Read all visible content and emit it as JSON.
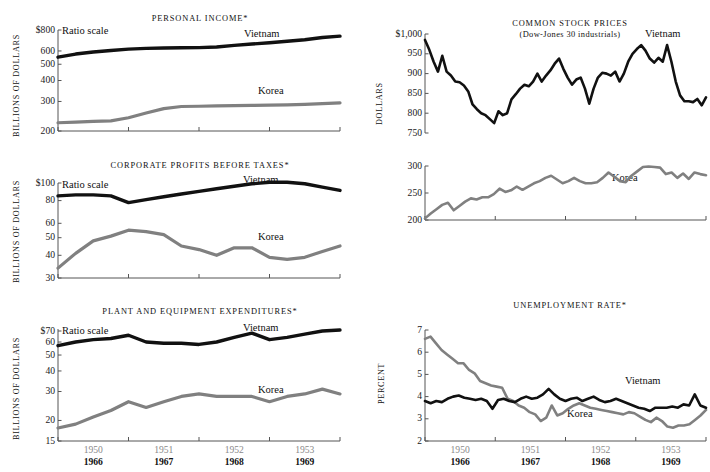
{
  "figure": {
    "series_names": [
      "Vietnam",
      "Korea"
    ],
    "vietnam_color": "#111111",
    "korea_color": "#808080",
    "axis_color": "#555555",
    "ratio_scale_note": "Ratio scale",
    "x_axis": {
      "top_years": [
        "1950",
        "1951",
        "1952",
        "1953"
      ],
      "bottom_years": [
        "1966",
        "1967",
        "1968",
        "1969"
      ]
    }
  },
  "panels": {
    "personal_income": {
      "title": "PERSONAL INCOME*",
      "ylabel": "BILLIONS OF DOLLARS",
      "ratio_note": "Ratio scale",
      "vietnam_label": "Vietnam",
      "korea_label": "Korea",
      "yticks": [
        "$800",
        "600",
        "500",
        "400",
        "300",
        "200"
      ]
    },
    "corporate_profits": {
      "title": "CORPORATE PROFITS BEFORE TAXES*",
      "ylabel": "BILLIONS OF DOLLARS",
      "ratio_note": "Ratio scale",
      "vietnam_label": "Vietnam",
      "korea_label": "Korea",
      "yticks": [
        "$100",
        "80",
        "60",
        "50",
        "40",
        "30"
      ]
    },
    "plant_equipment": {
      "title": "PLANT AND EQUIPMENT EXPENDITURES*",
      "ylabel": "BILLIONS OF DOLLARS",
      "ratio_note": "Ratio scale",
      "vietnam_label": "Vietnam",
      "korea_label": "Korea",
      "yticks": [
        "$70",
        "60",
        "50",
        "40",
        "30",
        "20",
        "15"
      ]
    },
    "stock_prices": {
      "title": "COMMON STOCK PRICES",
      "subtitle": "(Dow-Jones 30 industrials)",
      "ylabel": "DOLLARS",
      "vietnam_label": "Vietnam",
      "korea_label": "Korea",
      "yticks_top": [
        "$1,000",
        "950",
        "900",
        "850",
        "800",
        "750"
      ],
      "yticks_bottom": [
        "300",
        "250",
        "200"
      ]
    },
    "unemployment": {
      "title": "UNEMPLOYMENT RATE*",
      "ylabel": "PERCENT",
      "vietnam_label": "Vietnam",
      "korea_label": "Korea",
      "yticks": [
        "7",
        "6",
        "5",
        "4",
        "3",
        "2"
      ]
    }
  },
  "chart_data": [
    {
      "id": "personal_income",
      "type": "line",
      "title": "PERSONAL INCOME*",
      "xlabel": "",
      "ylabel": "BILLIONS OF DOLLARS",
      "yscale": "log",
      "ylim": [
        200,
        800
      ],
      "yticks": [
        200,
        300,
        400,
        500,
        600,
        800
      ],
      "grid": false,
      "legend": "inline-labels",
      "annotations": [
        "Ratio scale"
      ],
      "x": [
        0,
        1,
        2,
        3,
        4,
        5,
        6,
        7,
        8,
        9,
        10,
        11,
        12,
        13,
        14,
        15,
        16
      ],
      "series": [
        {
          "name": "Vietnam",
          "color": "#111111",
          "values": [
            551,
            575,
            592,
            604,
            615,
            622,
            625,
            627,
            628,
            633,
            648,
            660,
            672,
            686,
            700,
            722,
            735
          ]
        },
        {
          "name": "Korea",
          "color": "#808080",
          "values": [
            224,
            226,
            228,
            230,
            240,
            256,
            272,
            280,
            281,
            282,
            283,
            284,
            285,
            286,
            288,
            291,
            294
          ]
        }
      ]
    },
    {
      "id": "corporate_profits",
      "type": "line",
      "title": "CORPORATE PROFITS BEFORE TAXES*",
      "xlabel": "",
      "ylabel": "BILLIONS OF DOLLARS",
      "yscale": "log",
      "ylim": [
        30,
        100
      ],
      "yticks": [
        30,
        40,
        50,
        60,
        80,
        100
      ],
      "grid": false,
      "legend": "inline-labels",
      "annotations": [
        "Ratio scale"
      ],
      "x": [
        0,
        1,
        2,
        3,
        4,
        5,
        6,
        7,
        8,
        9,
        10,
        11,
        12,
        13,
        14,
        15,
        16
      ],
      "series": [
        {
          "name": "Vietnam",
          "color": "#111111",
          "values": [
            85,
            86,
            86,
            85,
            78,
            81,
            84,
            87,
            90,
            93,
            96,
            99,
            101,
            101,
            99,
            95,
            91
          ]
        },
        {
          "name": "Korea",
          "color": "#808080",
          "values": [
            34,
            41,
            48,
            51,
            55,
            54,
            52,
            45,
            43,
            40,
            44,
            44,
            39,
            38,
            39,
            42,
            45
          ]
        }
      ]
    },
    {
      "id": "plant_equipment",
      "type": "line",
      "title": "PLANT AND EQUIPMENT EXPENDITURES*",
      "xlabel": "",
      "ylabel": "BILLIONS OF DOLLARS",
      "yscale": "log",
      "ylim": [
        15,
        72
      ],
      "yticks": [
        15,
        20,
        30,
        40,
        50,
        60,
        70
      ],
      "grid": false,
      "legend": "inline-labels",
      "annotations": [
        "Ratio scale"
      ],
      "x": [
        0,
        1,
        2,
        3,
        4,
        5,
        6,
        7,
        8,
        9,
        10,
        11,
        12,
        13,
        14,
        15,
        16
      ],
      "series": [
        {
          "name": "Vietnam",
          "color": "#111111",
          "values": [
            57,
            60,
            62,
            63,
            66,
            60,
            59,
            59,
            58,
            60,
            64,
            68,
            62,
            64,
            67,
            70,
            71
          ]
        },
        {
          "name": "Korea",
          "color": "#808080",
          "values": [
            18,
            19,
            21,
            23,
            26,
            24,
            26,
            28,
            29,
            28,
            28,
            28,
            26,
            28,
            29,
            31,
            29
          ]
        }
      ]
    },
    {
      "id": "stock_prices",
      "type": "line",
      "title": "COMMON STOCK PRICES",
      "subtitle": "(Dow-Jones 30 industrials)",
      "xlabel": "",
      "ylabel": "DOLLARS",
      "yscale": "linear",
      "panels": [
        {
          "name": "Vietnam",
          "ylim": [
            750,
            1000
          ],
          "yticks": [
            750,
            800,
            850,
            900,
            950,
            1000
          ]
        },
        {
          "name": "Korea",
          "ylim": [
            200,
            300
          ],
          "yticks": [
            200,
            250,
            300
          ]
        }
      ],
      "grid": false,
      "legend": "inline-labels",
      "series": [
        {
          "name": "Vietnam",
          "color": "#111111",
          "values": [
            985,
            960,
            930,
            905,
            945,
            905,
            895,
            880,
            878,
            870,
            855,
            822,
            810,
            800,
            795,
            785,
            775,
            805,
            795,
            800,
            835,
            848,
            862,
            872,
            868,
            880,
            900,
            880,
            895,
            908,
            925,
            938,
            912,
            890,
            872,
            885,
            890,
            862,
            824,
            862,
            890,
            902,
            900,
            895,
            905,
            880,
            900,
            930,
            950,
            962,
            972,
            958,
            938,
            928,
            940,
            930,
            972,
            930,
            880,
            845,
            830,
            830,
            828,
            836,
            820,
            840
          ]
        },
        {
          "name": "Korea",
          "color": "#808080",
          "values": [
            203,
            212,
            220,
            228,
            232,
            218,
            226,
            234,
            240,
            238,
            242,
            242,
            248,
            258,
            252,
            255,
            262,
            256,
            262,
            268,
            272,
            278,
            282,
            275,
            268,
            272,
            278,
            272,
            268,
            268,
            270,
            278,
            288,
            280,
            272,
            270,
            282,
            290,
            298,
            299,
            298,
            297,
            285,
            288,
            278,
            286,
            276,
            288,
            285,
            283
          ]
        }
      ]
    },
    {
      "id": "unemployment",
      "type": "line",
      "title": "UNEMPLOYMENT RATE*",
      "xlabel": "",
      "ylabel": "PERCENT",
      "yscale": "linear",
      "ylim": [
        2,
        7
      ],
      "yticks": [
        2,
        3,
        4,
        5,
        6,
        7
      ],
      "grid": false,
      "legend": "inline-labels",
      "series": [
        {
          "name": "Vietnam",
          "color": "#111111",
          "values": [
            3.8,
            3.7,
            3.8,
            3.75,
            3.9,
            4.0,
            4.05,
            3.95,
            3.9,
            3.85,
            3.9,
            3.8,
            3.45,
            3.85,
            3.9,
            3.8,
            3.75,
            3.9,
            4.0,
            3.9,
            3.95,
            4.1,
            4.35,
            4.1,
            3.9,
            3.8,
            3.9,
            3.95,
            3.8,
            3.9,
            4.0,
            3.85,
            3.75,
            3.8,
            3.9,
            3.8,
            3.7,
            3.6,
            3.5,
            3.45,
            3.35,
            3.5,
            3.5,
            3.5,
            3.55,
            3.5,
            3.65,
            3.6,
            4.1,
            3.6,
            3.5
          ]
        },
        {
          "name": "Korea",
          "color": "#808080",
          "values": [
            6.6,
            6.7,
            6.4,
            6.1,
            5.9,
            5.7,
            5.5,
            5.5,
            5.2,
            5.05,
            4.7,
            4.6,
            4.5,
            4.45,
            4.4,
            3.9,
            3.8,
            3.6,
            3.5,
            3.3,
            3.2,
            2.9,
            3.05,
            3.6,
            3.15,
            3.25,
            3.45,
            3.6,
            3.7,
            3.6,
            3.5,
            3.45,
            3.4,
            3.35,
            3.3,
            3.25,
            3.2,
            3.3,
            3.25,
            3.1,
            2.95,
            2.85,
            3.05,
            2.9,
            2.65,
            2.6,
            2.7,
            2.7,
            2.75,
            2.95,
            3.15,
            3.4
          ]
        }
      ]
    }
  ]
}
